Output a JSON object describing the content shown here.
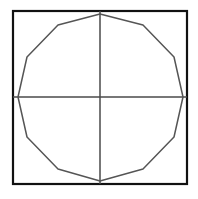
{
  "figure": {
    "background_color": "#ffffff",
    "width": 198,
    "height": 199
  },
  "square": {
    "name": "bounding-square",
    "x": 13,
    "y": 11,
    "width": 174,
    "height": 173,
    "stroke_color": "#111111",
    "stroke_width": 2.2,
    "fill": "none"
  },
  "axes": {
    "stroke_color": "#4a4a4a",
    "stroke_width": 1.5,
    "center_x": 100,
    "center_y": 97,
    "horizontal": {
      "label": "horizontal-axis",
      "x1": 13,
      "y1": 97,
      "x2": 187,
      "y2": 97
    },
    "vertical": {
      "label": "vertical-axis",
      "x1": 100,
      "y1": 11,
      "x2": 100,
      "y2": 184
    }
  },
  "polygon": {
    "name": "inscribed-dodecagon",
    "sides": 12,
    "stroke_color": "#555555",
    "stroke_width": 1.5,
    "fill": "none",
    "center_x": 100,
    "center_y": 97,
    "radius": 85,
    "points": "100,14 143,25 174,57 183,97 174,137 143,169 100,181 58,169 27,137 18,97 27,57 58,25",
    "vertices": [
      {
        "index": 1,
        "x": 100,
        "y": 14
      },
      {
        "index": 2,
        "x": 143,
        "y": 25
      },
      {
        "index": 3,
        "x": 174,
        "y": 57
      },
      {
        "index": 4,
        "x": 183,
        "y": 97
      },
      {
        "index": 5,
        "x": 174,
        "y": 137
      },
      {
        "index": 6,
        "x": 143,
        "y": 169
      },
      {
        "index": 7,
        "x": 100,
        "y": 181
      },
      {
        "index": 8,
        "x": 58,
        "y": 169
      },
      {
        "index": 9,
        "x": 27,
        "y": 137
      },
      {
        "index": 10,
        "x": 18,
        "y": 97
      },
      {
        "index": 11,
        "x": 27,
        "y": 57
      },
      {
        "index": 12,
        "x": 58,
        "y": 25
      }
    ]
  },
  "chart_data": {
    "type": "diagram",
    "shapes": [
      {
        "shape": "square",
        "corners": [
          [
            13,
            11
          ],
          [
            187,
            11
          ],
          [
            187,
            184
          ],
          [
            13,
            184
          ]
        ],
        "side_length": 174
      },
      {
        "shape": "regular-polygon",
        "sides": 12,
        "center": [
          100,
          97
        ],
        "circumradius": 85,
        "vertices": [
          [
            100,
            14
          ],
          [
            143,
            25
          ],
          [
            174,
            57
          ],
          [
            183,
            97
          ],
          [
            174,
            137
          ],
          [
            143,
            169
          ],
          [
            100,
            181
          ],
          [
            58,
            169
          ],
          [
            27,
            137
          ],
          [
            18,
            97
          ],
          [
            27,
            57
          ],
          [
            58,
            25
          ]
        ]
      },
      {
        "shape": "line",
        "name": "horizontal-axis",
        "from": [
          13,
          97
        ],
        "to": [
          187,
          97
        ]
      },
      {
        "shape": "line",
        "name": "vertical-axis",
        "from": [
          100,
          11
        ],
        "to": [
          100,
          184
        ]
      }
    ],
    "xlabel": "",
    "ylabel": "",
    "grid": false,
    "legend": null
  }
}
